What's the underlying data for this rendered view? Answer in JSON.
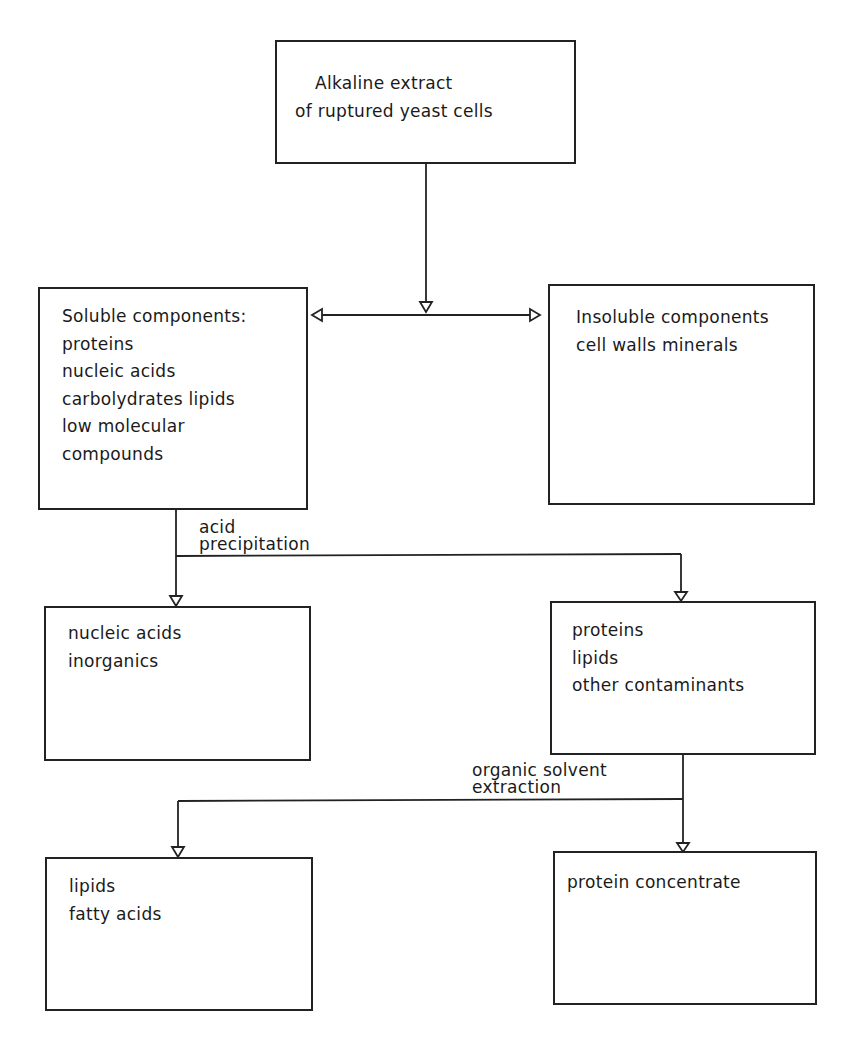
{
  "diagram": {
    "nodes": {
      "extract": {
        "lines": [
          "Alkaline extract",
          "of ruptured yeast cells"
        ]
      },
      "soluble": {
        "lines": [
          "Soluble components:",
          "proteins",
          "nucleic  acids",
          "carbolydrates lipids",
          "low molecular",
          "compounds"
        ]
      },
      "insoluble": {
        "lines": [
          "Insoluble components",
          "cell walls  minerals"
        ]
      },
      "nucleic": {
        "lines": [
          "nucleic  acids",
          "inorganics"
        ]
      },
      "proteins": {
        "lines": [
          "proteins",
          "lipids",
          "other contaminants"
        ]
      },
      "lipids": {
        "lines": [
          "lipids",
          "fatty acids"
        ]
      },
      "concentrate": {
        "lines": [
          "protein concentrate"
        ]
      }
    },
    "edge_labels": {
      "acid_precipitation": [
        "acid",
        "precipitation"
      ],
      "organic_solvent_extraction": [
        "organic solvent",
        "extraction"
      ]
    },
    "edges": [
      {
        "from": "extract",
        "to": "soluble"
      },
      {
        "from": "extract",
        "to": "insoluble"
      },
      {
        "from": "soluble",
        "to": "nucleic",
        "label": "acid precipitation"
      },
      {
        "from": "soluble",
        "to": "proteins",
        "label": "acid precipitation"
      },
      {
        "from": "proteins",
        "to": "lipids",
        "label": "organic solvent extraction"
      },
      {
        "from": "proteins",
        "to": "concentrate",
        "label": "organic solvent extraction"
      }
    ],
    "colors": {
      "line": "#222222",
      "background": "#ffffff"
    }
  }
}
